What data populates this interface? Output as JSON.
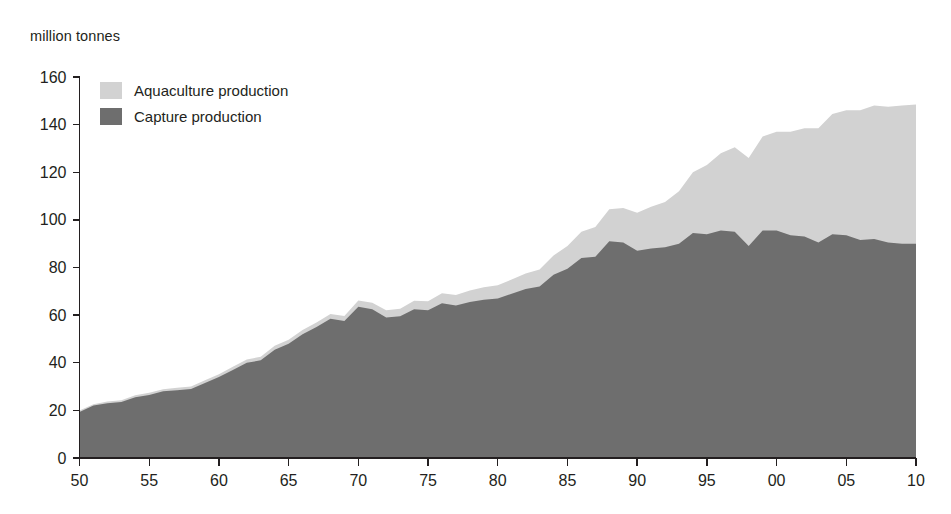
{
  "chart_data": {
    "type": "area",
    "stacked": true,
    "title": "",
    "ylabel": "million tonnes",
    "xlabel": "",
    "ylim": [
      0,
      160
    ],
    "xlim": [
      1950,
      2010
    ],
    "ytick_step": 20,
    "xtick_step": 5,
    "grid": false,
    "legend_position": "top-left",
    "y_ticks": [
      "0",
      "20",
      "40",
      "60",
      "80",
      "100",
      "120",
      "140",
      "160"
    ],
    "x_ticks": [
      "50",
      "55",
      "60",
      "65",
      "70",
      "75",
      "80",
      "85",
      "90",
      "95",
      "00",
      "05",
      "10"
    ],
    "x_tick_years": [
      1950,
      1955,
      1960,
      1965,
      1970,
      1975,
      1980,
      1985,
      1990,
      1995,
      2000,
      2005,
      2010
    ],
    "colors": {
      "aquaculture": "#d2d2d2",
      "capture": "#6e6e6e",
      "axis": "#231f20",
      "background": "#ffffff"
    },
    "x": [
      1950,
      1951,
      1952,
      1953,
      1954,
      1955,
      1956,
      1957,
      1958,
      1959,
      1960,
      1961,
      1962,
      1963,
      1964,
      1965,
      1966,
      1967,
      1968,
      1969,
      1970,
      1971,
      1972,
      1973,
      1974,
      1975,
      1976,
      1977,
      1978,
      1979,
      1980,
      1981,
      1982,
      1983,
      1984,
      1985,
      1986,
      1987,
      1988,
      1989,
      1990,
      1991,
      1992,
      1993,
      1994,
      1995,
      1996,
      1997,
      1998,
      1999,
      2000,
      2001,
      2002,
      2003,
      2004,
      2005,
      2006,
      2007,
      2008,
      2009,
      2010
    ],
    "series": [
      {
        "name": "Capture production",
        "color": "#6e6e6e",
        "values": [
          19.3,
          22.0,
          23.0,
          23.5,
          25.5,
          26.5,
          28.0,
          28.5,
          29.0,
          31.5,
          34.0,
          37.0,
          40.0,
          41.0,
          45.5,
          48.0,
          52.0,
          55.0,
          58.5,
          57.5,
          63.5,
          62.5,
          59.0,
          59.5,
          62.5,
          62.0,
          65.0,
          64.0,
          65.5,
          66.5,
          67.0,
          69.0,
          71.0,
          72.0,
          77.0,
          79.5,
          84.0,
          84.5,
          91.0,
          90.5,
          87.0,
          88.0,
          88.5,
          90.0,
          94.5,
          94.0,
          95.5,
          95.0,
          89.0,
          95.5,
          95.5,
          93.5,
          93.0,
          90.5,
          94.0,
          93.5,
          91.5,
          92.0,
          90.5,
          90.0,
          90.0
        ]
      },
      {
        "name": "Aquaculture production",
        "color": "#d2d2d2",
        "values": [
          0.6,
          0.6,
          0.7,
          0.7,
          0.8,
          0.9,
          0.9,
          1.0,
          1.0,
          1.1,
          1.2,
          1.3,
          1.4,
          1.5,
          1.6,
          1.7,
          1.8,
          1.9,
          2.0,
          2.1,
          2.6,
          2.7,
          3.0,
          3.2,
          3.5,
          3.8,
          4.2,
          4.5,
          4.8,
          5.2,
          5.5,
          6.0,
          6.5,
          7.2,
          8.0,
          9.5,
          11.0,
          12.5,
          13.5,
          14.5,
          16.0,
          17.5,
          19.0,
          22.0,
          25.5,
          29.0,
          32.5,
          35.5,
          37.0,
          39.5,
          41.5,
          43.5,
          45.5,
          48.0,
          50.5,
          52.5,
          54.5,
          56.0,
          57.0,
          58.0,
          58.5
        ]
      }
    ],
    "totals": [
      19.9,
      22.6,
      23.7,
      24.2,
      26.3,
      27.4,
      28.9,
      29.5,
      30.0,
      32.6,
      35.2,
      38.3,
      41.4,
      42.5,
      47.1,
      49.7,
      53.8,
      56.9,
      60.5,
      59.6,
      66.1,
      65.2,
      62.0,
      62.7,
      66.0,
      65.8,
      69.2,
      68.5,
      70.3,
      71.7,
      72.5,
      75.0,
      77.5,
      79.2,
      85.0,
      89.0,
      95.0,
      97.0,
      104.5,
      105.0,
      103.0,
      105.5,
      107.5,
      112.0,
      120.0,
      123.0,
      128.0,
      130.5,
      126.0,
      135.0,
      137.0,
      137.0,
      138.5,
      138.5,
      144.5,
      146.0,
      146.0,
      148.0,
      147.5,
      148.0,
      148.5
    ]
  },
  "legend": {
    "items": [
      {
        "label": "Aquaculture production",
        "color": "#d2d2d2"
      },
      {
        "label": "Capture production",
        "color": "#6e6e6e"
      }
    ]
  },
  "axis": {
    "y_title": "million tonnes"
  }
}
